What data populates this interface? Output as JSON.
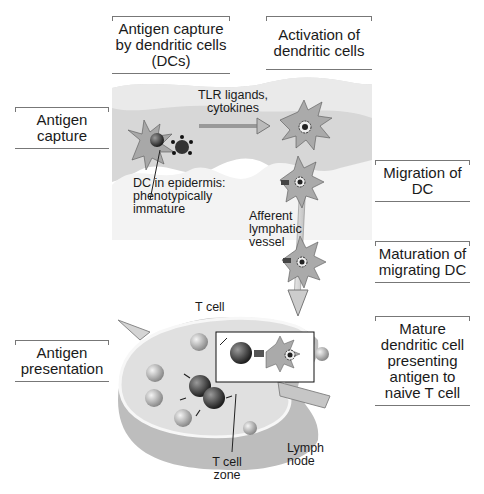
{
  "diagram": {
    "title_labels": {
      "antigen_capture_by_dcs": "Antigen capture by dendritic cells (DCs)",
      "activation_of_dcs": "Activation of dendritic cells"
    },
    "side_labels": {
      "antigen_capture": "Antigen capture",
      "migration_of_dc": "Migration of DC",
      "maturation_of_migrating_dc": "Maturation of migrating DC",
      "antigen_presentation": "Antigen presentation",
      "mature_dc_presenting": "Mature dendritic cell presenting antigen to naive T cell"
    },
    "annotations": {
      "tlr_ligands": "TLR ligands, cytokines",
      "dc_in_epidermis": "DC in epidermis: phenotypically immature",
      "afferent_lymphatic_vessel": "Afferent lymphatic vessel",
      "t_cell": "T cell",
      "t_cell_zone": "T cell zone",
      "lymph_node": "Lymph node"
    },
    "colors": {
      "skin": "#d9d9d9",
      "cell": "#a8a8a8",
      "dark_cell": "#3a3a3a",
      "node": "#cfcfcf",
      "line": "#777777"
    }
  }
}
